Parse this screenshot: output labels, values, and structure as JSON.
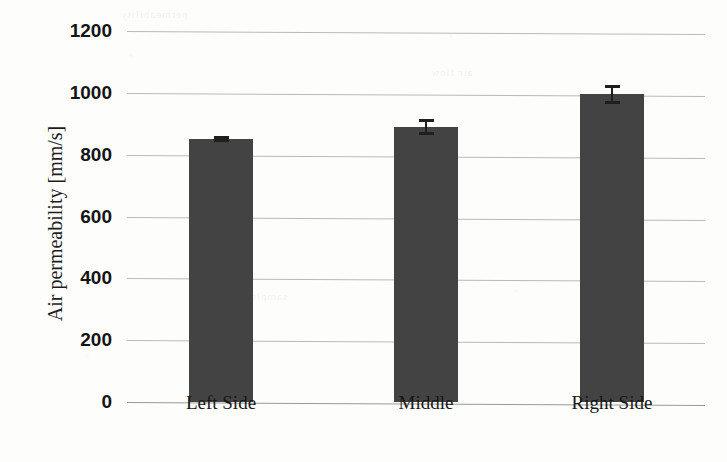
{
  "chart_data": {
    "type": "bar",
    "title": "",
    "subtitle": "",
    "xlabel": "",
    "ylabel": "Air permeability [mm/s]",
    "categories": [
      "Left Side",
      "Middle",
      "Right Side"
    ],
    "values": [
      850,
      890,
      995
    ],
    "errors": [
      10,
      25,
      30
    ],
    "ylim": [
      0,
      1200
    ],
    "ytick_labels": [
      "1200",
      "1000",
      "800",
      "600",
      "400",
      "200",
      "0"
    ],
    "ytick_values": [
      1200,
      1000,
      800,
      600,
      400,
      200,
      0
    ],
    "ytick_step": 200,
    "grid": true,
    "grid_axis": "y",
    "legend": false,
    "legend_position": "none",
    "bar_color": "#434343",
    "gridline_color": "#b9b9b9",
    "errorbar_color": "#1f1f1f",
    "background_color": "#fdfdfc",
    "text_color": "#141414"
  },
  "artifacts": {
    "bleed_1": "permeability",
    "bleed_2": "air flow",
    "bleed_3": "sample"
  }
}
